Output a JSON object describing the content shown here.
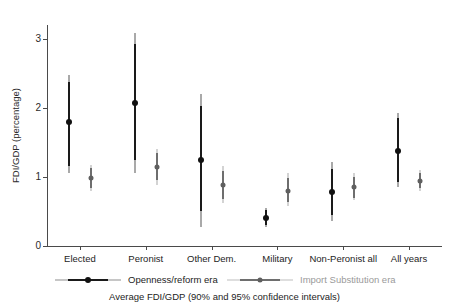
{
  "chart_data": {
    "type": "scatter",
    "title": "",
    "caption": "Average FDI/GDP (90% and 95% confidence intervals)",
    "xlabel": "",
    "ylabel": "FDI/GDP (percentage)",
    "ylim": [
      0,
      3.2
    ],
    "yticks": [
      0,
      1,
      2,
      3
    ],
    "ytick_labels": [
      "0",
      "1",
      "2",
      "3"
    ],
    "grid": false,
    "legend_position": "bottom",
    "categories": [
      "Elected",
      "Peronist",
      "Other Dem.",
      "Military",
      "Non-Peronist all",
      "All years"
    ],
    "series": [
      {
        "name": "Openness/reform era",
        "color": "#111111",
        "ci_color_90": "#1a1a1a",
        "ci_color_95": "#555555",
        "values": [
          1.8,
          2.07,
          1.25,
          0.41,
          0.78,
          1.38
        ],
        "ci90_low": [
          1.16,
          1.25,
          0.5,
          0.31,
          0.45,
          0.92
        ],
        "ci90_high": [
          2.38,
          2.93,
          2.02,
          0.52,
          1.12,
          1.85
        ],
        "ci95_low": [
          1.05,
          1.05,
          0.28,
          0.27,
          0.36,
          0.85
        ],
        "ci95_high": [
          2.48,
          3.09,
          2.2,
          0.55,
          1.21,
          1.93
        ]
      },
      {
        "name": "Import Substitution era",
        "color": "#5f5f5f",
        "ci_color_90": "#6e6e6e",
        "ci_color_95": "#a8a8a8",
        "values": [
          0.99,
          1.15,
          0.88,
          0.8,
          0.85,
          0.94
        ],
        "ci90_low": [
          0.84,
          0.95,
          0.68,
          0.63,
          0.7,
          0.84
        ],
        "ci90_high": [
          1.13,
          1.35,
          1.09,
          0.99,
          1.0,
          1.06
        ],
        "ci95_low": [
          0.79,
          0.89,
          0.62,
          0.58,
          0.66,
          0.8
        ],
        "ci95_high": [
          1.17,
          1.41,
          1.16,
          1.05,
          1.05,
          1.1
        ]
      }
    ]
  },
  "axes": {
    "y_title": "FDI/GDP (percentage)"
  },
  "legend": {
    "entries": [
      {
        "label": "Openness/reform era"
      },
      {
        "label": "Import Substitution era"
      }
    ]
  },
  "footer": {
    "caption": "Average FDI/GDP (90% and 95% confidence intervals)"
  }
}
